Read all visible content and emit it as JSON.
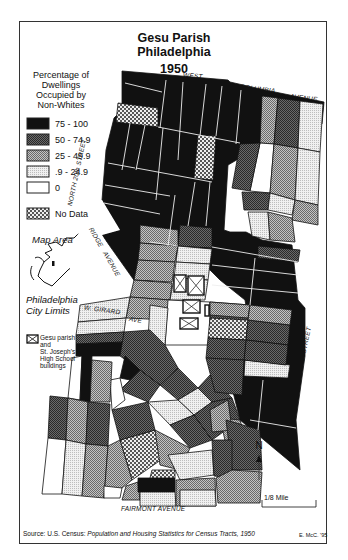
{
  "title": {
    "line1": "Gesu Parish",
    "line2": "Philadelphia",
    "year": "1950"
  },
  "legend": {
    "heading": [
      "Percentage of",
      "Dwellings",
      "Occupied  by",
      "Non-Whites"
    ],
    "items": [
      {
        "label": "75 - 100",
        "fill": "#111111",
        "pattern": "solid"
      },
      {
        "label": "50 - 74.9",
        "fill": "#555555",
        "pattern": "dense-dots"
      },
      {
        "label": "25 - 49.9",
        "fill": "#9a9a9a",
        "pattern": "medium-dots"
      },
      {
        "label": ".9 - 24.9",
        "fill": "#d6d6d6",
        "pattern": "light-dots"
      },
      {
        "label": "0",
        "fill": "#ffffff",
        "pattern": "empty"
      },
      {
        "label": "No Data",
        "fill": "#bbbbbb",
        "pattern": "checker"
      }
    ],
    "gesu_buildings": [
      "Gesu parish",
      "and",
      "St. Joseph's",
      "High School",
      "buildings"
    ]
  },
  "inset": {
    "map_area_label": "Map Area",
    "city_limits_label": [
      "Philadelphia",
      "City Limits"
    ]
  },
  "streets": {
    "west": "WEST",
    "columbia": "COLUMBIA",
    "avenue_top": "AVENUE",
    "north_20th": "NORTH  20th  STREET",
    "ridge": "RIDGE",
    "ridge_avenue": "AVENUE",
    "w_girard": "W. GIRARD",
    "girard_ave": "AVE",
    "north_15th": "NORTH  15th  STREET",
    "fairmont": "FAIRMONT   AVENUE"
  },
  "north_arrow": {
    "label": "N"
  },
  "scale_bar": {
    "label": "1/8 Mile"
  },
  "footer": {
    "source_prefix": "Source: U.S. Census: ",
    "source_title": "Population and Housing Statistics for Census Tracts, 1950",
    "credit": "E. McC. '95"
  },
  "colors": {
    "c75_100": "#111111",
    "c50_75": "#555555",
    "c25_50": "#9a9a9a",
    "c1_25": "#d8d8d8",
    "c0": "#ffffff",
    "nodata": "#bcbcbc"
  }
}
